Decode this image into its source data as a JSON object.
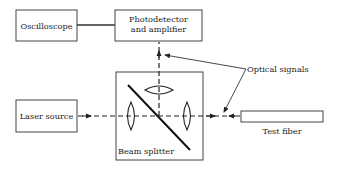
{
  "diagram": {
    "type": "optical-block-diagram",
    "components": {
      "oscilloscope": {
        "label": "Oscilloscope"
      },
      "photodetector": {
        "label_line1": "Photodetector",
        "label_line2": "and amplifier"
      },
      "laser": {
        "label": "Laser source"
      },
      "beam_splitter": {
        "label": "Beam splitter"
      },
      "test_fiber": {
        "label": "Test fiber"
      }
    },
    "annotations": {
      "optical_signals": "Optical signals"
    },
    "colors": {
      "stroke": "#333333",
      "background": "#ffffff"
    }
  }
}
